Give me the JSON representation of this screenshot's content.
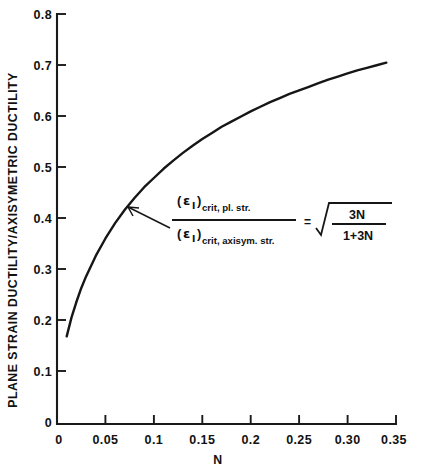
{
  "chart_data": {
    "type": "line",
    "title": "",
    "xlabel": "N",
    "ylabel": "PLANE STRAIN DUCTILITY/AXISYMETRIC DUCTILITY",
    "xlim": [
      0,
      0.35
    ],
    "ylim": [
      0,
      0.8
    ],
    "grid": false,
    "legend": null,
    "equation_text": "(εI)crit, pl. str. / (εI)crit, axisym. str. = sqrt(3N/(1+3N))",
    "xticks": [
      "0",
      "0.05",
      "0.1",
      "0.15",
      "0.2",
      "0.25",
      "0.30",
      "0.35"
    ],
    "xtick_values": [
      0,
      0.05,
      0.1,
      0.15,
      0.2,
      0.25,
      0.3,
      0.35
    ],
    "yticks": [
      "0",
      "0.1",
      "0.2",
      "0.3",
      "0.4",
      "0.5",
      "0.6",
      "0.7",
      "0.8"
    ],
    "ytick_values": [
      0,
      0.1,
      0.2,
      0.3,
      0.4,
      0.5,
      0.6,
      0.7,
      0.8
    ],
    "series": [
      {
        "name": "sqrt(3N/(1+3N))",
        "x": [
          0.01,
          0.015,
          0.02,
          0.025,
          0.03,
          0.04,
          0.05,
          0.06,
          0.07,
          0.08,
          0.09,
          0.1,
          0.11,
          0.12,
          0.13,
          0.14,
          0.15,
          0.16,
          0.17,
          0.18,
          0.19,
          0.2,
          0.21,
          0.22,
          0.23,
          0.24,
          0.25,
          0.26,
          0.27,
          0.28,
          0.29,
          0.3,
          0.31,
          0.32,
          0.33,
          0.34
        ],
        "y": [
          0.171,
          0.208,
          0.238,
          0.265,
          0.288,
          0.328,
          0.362,
          0.392,
          0.418,
          0.441,
          0.462,
          0.48,
          0.498,
          0.514,
          0.529,
          0.543,
          0.556,
          0.568,
          0.58,
          0.59,
          0.6,
          0.61,
          0.619,
          0.628,
          0.636,
          0.644,
          0.651,
          0.658,
          0.665,
          0.672,
          0.678,
          0.684,
          0.69,
          0.695,
          0.7,
          0.705
        ]
      }
    ]
  },
  "annotation": {
    "numerator_symbol": "ε",
    "numerator_sub_roman": "I",
    "numerator_sub": "crit, pl. str.",
    "denominator_symbol": "ε",
    "denominator_sub_roman": "I",
    "denominator_sub": "crit, axisym. str.",
    "equals": "=",
    "radical_numerator": "3N",
    "radical_denominator": "1+3N"
  },
  "axes": {
    "x_title": "N",
    "y_title": "PLANE STRAIN DUCTILITY/AXISYMETRIC DUCTILITY"
  }
}
